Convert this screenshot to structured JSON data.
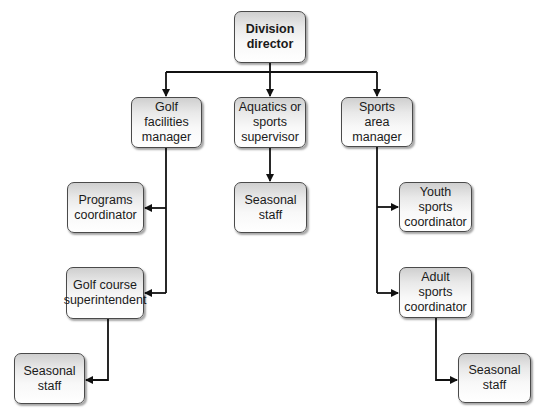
{
  "diagram": {
    "type": "org-chart",
    "nodes": [
      {
        "id": "division_director",
        "label": "Division\ndirector",
        "bold": true,
        "x": 234,
        "y": 11,
        "w": 72,
        "h": 52
      },
      {
        "id": "golf_facilities_manager",
        "label": "Golf facilities\nmanager",
        "x": 131,
        "y": 97,
        "w": 71,
        "h": 51
      },
      {
        "id": "aquatics_supervisor",
        "label": "Aquatics or\nsports\nsupervisor",
        "x": 234,
        "y": 97,
        "w": 72,
        "h": 51
      },
      {
        "id": "sports_area_manager",
        "label": "Sports area\nmanager",
        "x": 341,
        "y": 97,
        "w": 72,
        "h": 50
      },
      {
        "id": "programs_coordinator",
        "label": "Programs\ncoordinator",
        "x": 67,
        "y": 182,
        "w": 77,
        "h": 51
      },
      {
        "id": "seasonal_staff_center",
        "label": "Seasonal\nstaff",
        "x": 234,
        "y": 182,
        "w": 73,
        "h": 51
      },
      {
        "id": "youth_sports_coordinator",
        "label": "Youth sports\ncoordinator",
        "x": 399,
        "y": 182,
        "w": 73,
        "h": 50
      },
      {
        "id": "golf_course_superintendent",
        "label": "Golf course\nsuperintendent",
        "x": 66,
        "y": 267,
        "w": 78,
        "h": 52
      },
      {
        "id": "adult_sports_coordinator",
        "label": "Adult sports\ncoordinator",
        "x": 399,
        "y": 267,
        "w": 73,
        "h": 51
      },
      {
        "id": "seasonal_staff_left",
        "label": "Seasonal\nstaff",
        "x": 14,
        "y": 353,
        "w": 71,
        "h": 51
      },
      {
        "id": "seasonal_staff_right",
        "label": "Seasonal\nstaff",
        "x": 458,
        "y": 353,
        "w": 73,
        "h": 50
      }
    ],
    "edges": [
      {
        "from": "division_director",
        "to": "golf_facilities_manager"
      },
      {
        "from": "division_director",
        "to": "aquatics_supervisor"
      },
      {
        "from": "division_director",
        "to": "sports_area_manager"
      },
      {
        "from": "golf_facilities_manager",
        "to": "programs_coordinator"
      },
      {
        "from": "golf_facilities_manager",
        "to": "golf_course_superintendent"
      },
      {
        "from": "golf_course_superintendent",
        "to": "seasonal_staff_left"
      },
      {
        "from": "aquatics_supervisor",
        "to": "seasonal_staff_center"
      },
      {
        "from": "sports_area_manager",
        "to": "youth_sports_coordinator"
      },
      {
        "from": "sports_area_manager",
        "to": "adult_sports_coordinator"
      },
      {
        "from": "adult_sports_coordinator",
        "to": "seasonal_staff_right"
      }
    ],
    "colors": {
      "line": "#111111",
      "border": "#4a4a4a",
      "gradient_top": "#cfcfcf",
      "gradient_bottom": "#ffffff"
    }
  }
}
